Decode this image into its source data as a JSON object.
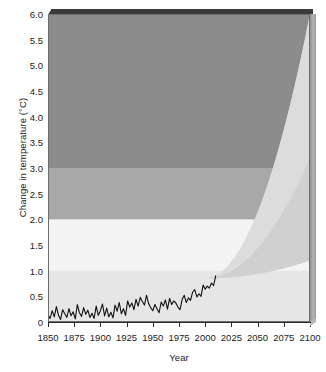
{
  "chart_data": {
    "type": "area",
    "title": "",
    "xlabel": "Year",
    "ylabel": "Change in temperature (°C)",
    "xlim": [
      1850,
      2100
    ],
    "ylim": [
      0,
      6.0
    ],
    "xticks": [
      1850,
      1875,
      1900,
      1925,
      1950,
      1975,
      2000,
      2025,
      2050,
      2075,
      2100
    ],
    "yticks": [
      "0",
      "0.5",
      "1.0",
      "1.5",
      "2.0",
      "2.5",
      "3.0",
      "3.5",
      "4.0",
      "4.5",
      "5.0",
      "5.5",
      "6.0"
    ],
    "grid": false,
    "legend": "none",
    "background_bands": [
      {
        "name": "below-1C-band",
        "from": 0.0,
        "to": 1.0,
        "color": "#e6e6e6"
      },
      {
        "name": "1-to-2C-band",
        "from": 1.0,
        "to": 2.0,
        "color": "#f4f4f4"
      },
      {
        "name": "2-to-3C-band",
        "from": 2.0,
        "to": 3.0,
        "color": "#a8a8a8"
      },
      {
        "name": "above-3C-band",
        "from": 3.0,
        "to": 6.0,
        "color": "#8c8c8c"
      }
    ],
    "projection_cone": {
      "name": "projected-warming-range",
      "start_year": 2000,
      "upper_bound_2100": 6.0,
      "lower_bound_2100": 1.2,
      "inner_bound_2100": 3.2,
      "outer_color": "#dcdcdc",
      "inner_color": "#d0d0d0"
    },
    "series": [
      {
        "name": "observed-temperature",
        "label": "Observed change in temperature",
        "color": "#111111",
        "start_year": 1850,
        "end_year": 2010,
        "start_value": 0.12,
        "end_value": 0.9,
        "x": [
          1850,
          1852,
          1854,
          1856,
          1858,
          1860,
          1862,
          1864,
          1866,
          1868,
          1870,
          1872,
          1874,
          1876,
          1878,
          1880,
          1882,
          1884,
          1886,
          1888,
          1890,
          1892,
          1894,
          1896,
          1898,
          1900,
          1902,
          1904,
          1906,
          1908,
          1910,
          1912,
          1914,
          1916,
          1918,
          1920,
          1922,
          1924,
          1926,
          1928,
          1930,
          1932,
          1934,
          1936,
          1938,
          1940,
          1942,
          1944,
          1946,
          1948,
          1950,
          1952,
          1954,
          1956,
          1958,
          1960,
          1962,
          1964,
          1966,
          1968,
          1970,
          1972,
          1974,
          1976,
          1978,
          1980,
          1982,
          1984,
          1986,
          1988,
          1990,
          1992,
          1994,
          1996,
          1998,
          2000,
          2002,
          2004,
          2006,
          2008,
          2010
        ],
        "y": [
          0.14,
          0.07,
          0.22,
          0.1,
          0.3,
          0.13,
          0.05,
          0.24,
          0.16,
          0.09,
          0.26,
          0.12,
          0.2,
          0.06,
          0.34,
          0.18,
          0.11,
          0.28,
          0.15,
          0.23,
          0.09,
          0.17,
          0.07,
          0.31,
          0.13,
          0.22,
          0.35,
          0.12,
          0.27,
          0.1,
          0.19,
          0.08,
          0.33,
          0.21,
          0.38,
          0.16,
          0.26,
          0.13,
          0.41,
          0.29,
          0.37,
          0.24,
          0.44,
          0.31,
          0.48,
          0.4,
          0.33,
          0.52,
          0.36,
          0.28,
          0.22,
          0.34,
          0.26,
          0.18,
          0.39,
          0.31,
          0.43,
          0.25,
          0.46,
          0.34,
          0.41,
          0.37,
          0.29,
          0.24,
          0.44,
          0.52,
          0.38,
          0.47,
          0.42,
          0.58,
          0.63,
          0.49,
          0.55,
          0.5,
          0.72,
          0.64,
          0.7,
          0.66,
          0.76,
          0.71,
          0.9
        ]
      }
    ]
  }
}
